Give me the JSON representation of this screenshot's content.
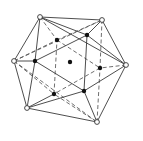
{
  "diagram": {
    "title": "",
    "type": "polyhedron-projection",
    "colors": {
      "line": "#3a3a3a",
      "vertex_filled": "#111111",
      "vertex_open": "#ffffff"
    },
    "vertices": {
      "A": {
        "x": 40,
        "y": 17,
        "style": "open"
      },
      "B": {
        "x": 102,
        "y": 20,
        "style": "open"
      },
      "C": {
        "x": 126,
        "y": 65,
        "style": "open"
      },
      "D": {
        "x": 97,
        "y": 122,
        "style": "open"
      },
      "E": {
        "x": 27,
        "y": 108,
        "style": "open"
      },
      "F": {
        "x": 14,
        "y": 61,
        "style": "open"
      },
      "G": {
        "x": 57,
        "y": 40,
        "style": "filled"
      },
      "H": {
        "x": 87,
        "y": 35,
        "style": "filled"
      },
      "I": {
        "x": 100,
        "y": 68,
        "style": "filled"
      },
      "J": {
        "x": 84,
        "y": 91,
        "style": "filled"
      },
      "K": {
        "x": 54,
        "y": 94,
        "style": "filled"
      },
      "L": {
        "x": 35,
        "y": 61,
        "style": "filled"
      },
      "O": {
        "x": 70,
        "y": 62,
        "style": "filled"
      }
    },
    "solid_edges": [
      [
        "A",
        "B"
      ],
      [
        "B",
        "C"
      ],
      [
        "C",
        "D"
      ],
      [
        "D",
        "E"
      ],
      [
        "E",
        "F"
      ],
      [
        "F",
        "A"
      ],
      [
        "A",
        "L"
      ],
      [
        "A",
        "H"
      ],
      [
        "A",
        "C"
      ],
      [
        "B",
        "H"
      ],
      [
        "C",
        "H"
      ],
      [
        "C",
        "J"
      ],
      [
        "D",
        "J"
      ],
      [
        "E",
        "J"
      ],
      [
        "E",
        "L"
      ],
      [
        "F",
        "L"
      ],
      [
        "E",
        "K"
      ],
      [
        "L",
        "H"
      ],
      [
        "H",
        "J"
      ],
      [
        "J",
        "L"
      ]
    ],
    "dashed_edges": [
      [
        "G",
        "I"
      ],
      [
        "I",
        "K"
      ],
      [
        "K",
        "G"
      ],
      [
        "A",
        "G"
      ],
      [
        "B",
        "G"
      ],
      [
        "F",
        "G"
      ],
      [
        "F",
        "B"
      ],
      [
        "B",
        "I"
      ],
      [
        "C",
        "I"
      ],
      [
        "D",
        "I"
      ],
      [
        "D",
        "K"
      ],
      [
        "F",
        "K"
      ],
      [
        "F",
        "D"
      ]
    ]
  }
}
